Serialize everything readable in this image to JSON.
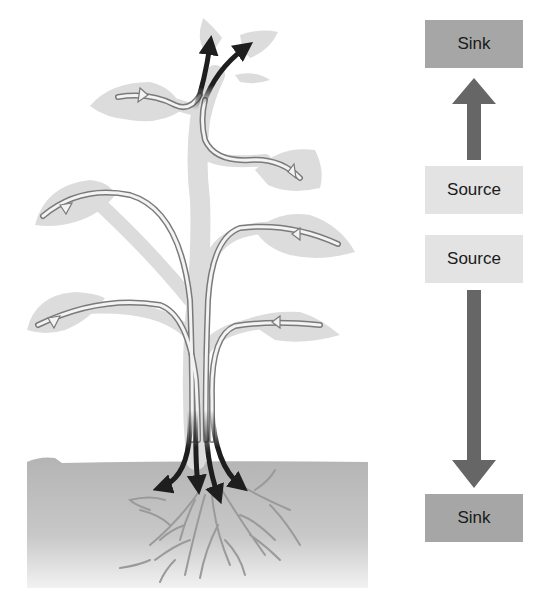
{
  "diagram": {
    "legend": {
      "top_sink": "Sink",
      "upper_source": "Source",
      "lower_source": "Source",
      "bottom_sink": "Sink"
    },
    "arrows": {
      "up": "Source → Sink (upward)",
      "down": "Source → Sink (downward)"
    },
    "colors": {
      "sink_box": "#a6a6a6",
      "source_box": "#e3e3e3",
      "flow_arrow": "#666666",
      "leaf": "#dcdcdc",
      "soil": "#b8b8b8",
      "phloem_sink_flow": "#1e1e1e"
    },
    "parts": [
      "leaves (source)",
      "shoot tip (sink)",
      "stem",
      "roots (sink)",
      "soil"
    ]
  }
}
